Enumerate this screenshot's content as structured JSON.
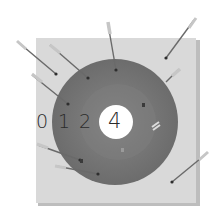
{
  "scene": {
    "description": "Archery target illustration with arrows",
    "colors": {
      "background": "#ffffff",
      "board": "#d8d8d8",
      "board_shadow": "#bcbcbc",
      "outer_ring": "#707070",
      "inner_ring": "#808080",
      "bullseye": "#ffffff",
      "text": "#2a2a2a",
      "arrow_shaft": "#6a6a6a",
      "fletching": "#c8c8c8"
    }
  },
  "target": {
    "ring_labels": [
      "0",
      "1",
      "2"
    ],
    "bullseye_label": "4"
  },
  "arrows": [
    {
      "id": "a1",
      "tail": [
        18,
        42
      ],
      "tip": [
        56,
        74
      ],
      "hit": "board"
    },
    {
      "id": "a2",
      "tail": [
        50,
        45
      ],
      "tip": [
        88,
        78
      ],
      "hit": "target"
    },
    {
      "id": "a3",
      "tail": [
        108,
        24
      ],
      "tip": [
        116,
        70
      ],
      "hit": "target"
    },
    {
      "id": "a4",
      "tail": [
        194,
        20
      ],
      "tip": [
        166,
        58
      ],
      "hit": "board"
    },
    {
      "id": "a5",
      "tail": [
        176,
        72
      ],
      "tip": [
        166,
        80
      ],
      "hit": "target-edge"
    },
    {
      "id": "a6",
      "tail": [
        32,
        75
      ],
      "tip": [
        68,
        104
      ],
      "hit": "target"
    },
    {
      "id": "a7",
      "tail": [
        38,
        145
      ],
      "tip": [
        80,
        160
      ],
      "hit": "target"
    },
    {
      "id": "a8",
      "tail": [
        56,
        166
      ],
      "tip": [
        98,
        174
      ],
      "hit": "target"
    },
    {
      "id": "a9",
      "tail": [
        206,
        154
      ],
      "tip": [
        172,
        182
      ],
      "hit": "board"
    }
  ],
  "embedded_hits": [
    [
      144,
      105
    ],
    [
      122,
      150
    ],
    [
      81,
      161
    ]
  ],
  "end_on_arrow": {
    "pos": [
      156,
      124
    ]
  }
}
